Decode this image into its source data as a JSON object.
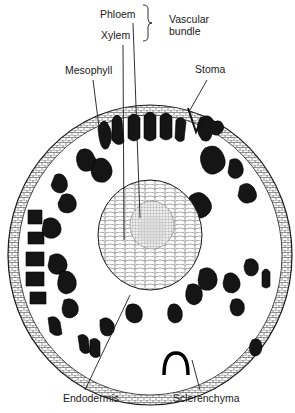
{
  "figure": {
    "labels": {
      "phloem": "Phloem",
      "xylem": "Xylem",
      "vascular_bundle_line1": "Vascular",
      "vascular_bundle_line2": "bundle",
      "mesophyll": "Mesophyll",
      "stoma": "Stoma",
      "endodermis": "Endodermis",
      "sclerenchyma": "Sclerenchyma"
    },
    "colors": {
      "ink": "#1a1a1a",
      "background": "#ffffff",
      "cell_dark": "#151515",
      "cell_light": "#f4f4f4"
    }
  }
}
